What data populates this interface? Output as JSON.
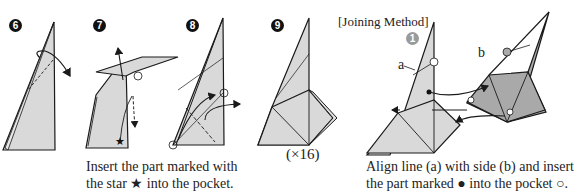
{
  "steps": [
    {
      "number": "6"
    },
    {
      "number": "7",
      "caption_line1": "Insert the part marked with",
      "caption_line2": "the star ★ into the pocket."
    },
    {
      "number": "8"
    },
    {
      "number": "9",
      "multiplier": "(×16)"
    }
  ],
  "joining": {
    "title": "[Joining Method]",
    "step_number": "1",
    "label_a": "a",
    "label_b": "b",
    "caption_line1": "Align line (a) with side (b) and insert",
    "caption_line2": "the part marked ● into the pocket ○."
  },
  "colors": {
    "paper_light": "#d9d9d9",
    "paper_dark": "#a9a9a9",
    "line": "#1a1a1a"
  }
}
